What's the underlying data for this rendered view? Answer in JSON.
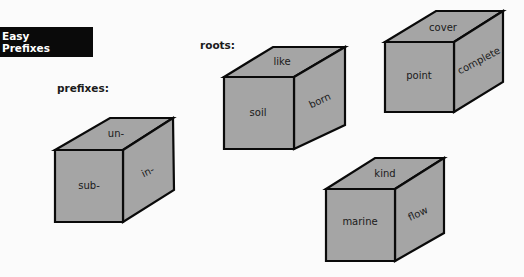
{
  "title": {
    "line1": "Easy",
    "line2": "Prefixes"
  },
  "labels": {
    "prefixes": "prefixes:",
    "roots": "roots:"
  },
  "colors": {
    "cube_fill": "#a5a5a5",
    "outline": "#0a0a0a",
    "title_bg": "#0a0a0a",
    "title_text": "#ffffff"
  },
  "cubes": [
    {
      "group": "prefixes",
      "top": "un-",
      "front": "sub-",
      "side": "in-"
    },
    {
      "group": "roots",
      "top": "like",
      "front": "soil",
      "side": "born"
    },
    {
      "group": "roots",
      "top": "cover",
      "front": "point",
      "side": "complete"
    },
    {
      "group": "roots",
      "top": "kind",
      "front": "marine",
      "side": "flow"
    }
  ]
}
